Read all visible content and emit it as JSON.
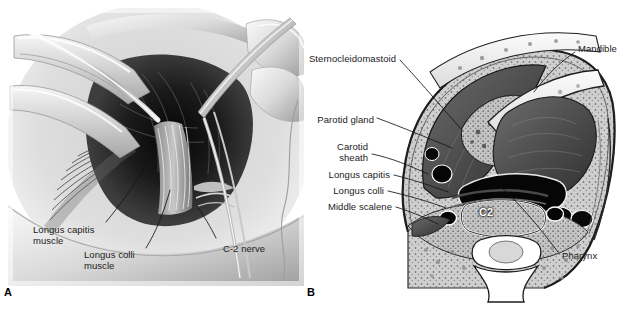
{
  "figure": {
    "background_color": "#ffffff",
    "width": 625,
    "height": 310
  },
  "panels": [
    {
      "id": "A",
      "letter": "A",
      "type": "surgical-photograph",
      "description": "Intraoperative anterolateral approach to the upper cervical spine showing retractors, surgeon's fingers and a dissecting instrument",
      "labels": [
        {
          "name": "longus-capitis-muscle",
          "text": "Longus capitis\nmuscle",
          "align": "left",
          "x": 33,
          "y": 224
        },
        {
          "name": "longus-colli-muscle",
          "text": "Longus colli\nmuscle",
          "align": "left",
          "x": 84,
          "y": 249
        },
        {
          "name": "c2-nerve",
          "text": "C-2 nerve",
          "align": "left",
          "x": 223,
          "y": 243
        }
      ]
    },
    {
      "id": "B",
      "letter": "B",
      "type": "anatomic-cross-section",
      "description": "Axial cross-section of the neck at the level of the C2 vertebral body",
      "inline_labels": [
        {
          "name": "c2-vertebral-body",
          "text": "C2",
          "x": 487,
          "y": 214,
          "color": "#ffffff"
        }
      ],
      "labels_left": [
        {
          "name": "sternocleidomastoid",
          "text": "Sternocleidomastoid",
          "align": "right",
          "x": 324,
          "y": 53
        },
        {
          "name": "parotid-gland",
          "text": "Parotid gland",
          "align": "right",
          "x": 324,
          "y": 114
        },
        {
          "name": "carotid-sheath",
          "text": "Carotid\nsheath",
          "align": "right",
          "x": 324,
          "y": 147
        },
        {
          "name": "longus-capitis",
          "text": "Longus capitis",
          "align": "right",
          "x": 324,
          "y": 172
        },
        {
          "name": "longus-colli",
          "text": "Longus colli",
          "align": "right",
          "x": 324,
          "y": 188
        },
        {
          "name": "middle-scalene",
          "text": "Middle scalene",
          "align": "right",
          "x": 324,
          "y": 204
        }
      ],
      "labels_right": [
        {
          "name": "mandible",
          "text": "Mandible",
          "align": "left",
          "x": 578,
          "y": 48
        },
        {
          "name": "pharynx",
          "text": "Pharynx",
          "align": "left",
          "x": 560,
          "y": 255
        }
      ]
    }
  ],
  "colors": {
    "ink": "#1b1b1b",
    "leader_line": "#111111",
    "panel_letter": "#000000",
    "background": "#ffffff",
    "tissue_light": "#d8d8d8",
    "tissue_mid": "#9a9a9a",
    "tissue_dark": "#4a4a4a",
    "vessel_black": "#0c0c0c",
    "bone_white": "#f2f2f2"
  }
}
